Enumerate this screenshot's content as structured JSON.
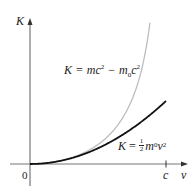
{
  "chart_data": {
    "type": "line",
    "title": "",
    "xlabel": "v",
    "ylabel": "K",
    "x_ticks": [
      {
        "value": 0,
        "label": "0"
      },
      {
        "value": 1,
        "label": "c"
      }
    ],
    "grid": false,
    "series": [
      {
        "name": "K = mc^2 - m0c^2",
        "label": "K = mc² − m₀c²",
        "color": "#b8b8b8",
        "kind": "relativistic",
        "x": [
          0,
          0.2,
          0.4,
          0.5,
          0.6,
          0.7,
          0.8,
          0.85,
          0.88
        ],
        "y": [
          0,
          0.0206,
          0.0911,
          0.1547,
          0.25,
          0.4003,
          0.6667,
          0.8983,
          1.1053
        ]
      },
      {
        "name": "K = 1/2 m0 v^2",
        "label": "K = ½m₀v²",
        "color": "#111111",
        "kind": "classical",
        "x": [
          0,
          0.2,
          0.4,
          0.5,
          0.6,
          0.7,
          0.8,
          0.9,
          1.0
        ],
        "y": [
          0,
          0.02,
          0.08,
          0.125,
          0.18,
          0.245,
          0.32,
          0.405,
          0.5
        ]
      }
    ],
    "units": "x in units of c, y in units of m0c^2"
  },
  "labels": {
    "y_axis": "K",
    "x_axis": "v",
    "origin": "0",
    "c_tick": "c",
    "rel_K": "K",
    "rel_eq": "=",
    "rel_m": "mc",
    "rel_sup1": "2",
    "rel_minus": "−",
    "rel_m0": "m",
    "rel_sub0": "0",
    "rel_c": "c",
    "rel_sup2": "2",
    "cls_K": "K",
    "cls_eq": "=",
    "cls_num": "1",
    "cls_den": "2",
    "cls_m": "m",
    "cls_sub0": "0",
    "cls_v": "v",
    "cls_sup": "2"
  }
}
